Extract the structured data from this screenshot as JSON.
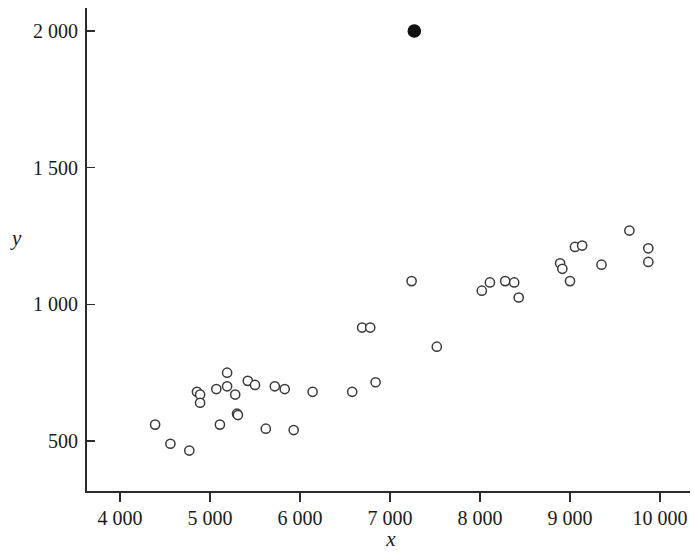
{
  "chart_data": {
    "type": "scatter",
    "title": "",
    "subtitle": "",
    "xlabel": "x",
    "ylabel": "y",
    "xlim": [
      3700,
      10300
    ],
    "ylim": [
      390,
      2060
    ],
    "grid": false,
    "legend": null,
    "xticks": [
      4000,
      5000,
      6000,
      7000,
      8000,
      9000,
      10000
    ],
    "xtick_labels": [
      "4 000",
      "5 000",
      "6 000",
      "7 000",
      "8 000",
      "9 000",
      "10 000"
    ],
    "yticks": [
      500,
      1000,
      1500,
      2000
    ],
    "ytick_labels": [
      "500",
      "1 000",
      "1 500",
      "2 000"
    ],
    "series": [
      {
        "name": "observations",
        "marker": "open-circle",
        "marker_color": "#3a3a3a",
        "points": [
          [
            4390,
            560
          ],
          [
            4560,
            490
          ],
          [
            4770,
            465
          ],
          [
            4855,
            680
          ],
          [
            4890,
            670
          ],
          [
            4890,
            640
          ],
          [
            5070,
            690
          ],
          [
            5110,
            560
          ],
          [
            5190,
            750
          ],
          [
            5190,
            700
          ],
          [
            5280,
            670
          ],
          [
            5300,
            600
          ],
          [
            5310,
            595
          ],
          [
            5420,
            720
          ],
          [
            5500,
            705
          ],
          [
            5620,
            545
          ],
          [
            5720,
            700
          ],
          [
            5830,
            690
          ],
          [
            5930,
            540
          ],
          [
            6140,
            680
          ],
          [
            6580,
            680
          ],
          [
            6690,
            915
          ],
          [
            6780,
            915
          ],
          [
            6840,
            715
          ],
          [
            7240,
            1085
          ],
          [
            7520,
            845
          ],
          [
            8020,
            1050
          ],
          [
            8110,
            1080
          ],
          [
            8280,
            1085
          ],
          [
            8380,
            1080
          ],
          [
            8430,
            1025
          ],
          [
            8890,
            1150
          ],
          [
            8915,
            1130
          ],
          [
            9000,
            1085
          ],
          [
            9055,
            1210
          ],
          [
            9135,
            1215
          ],
          [
            9350,
            1145
          ],
          [
            9660,
            1270
          ],
          [
            9870,
            1205
          ],
          [
            9870,
            1155
          ]
        ]
      },
      {
        "name": "outlier",
        "marker": "filled-circle",
        "marker_color": "#111111",
        "points": [
          [
            7270,
            2000
          ]
        ]
      }
    ]
  }
}
